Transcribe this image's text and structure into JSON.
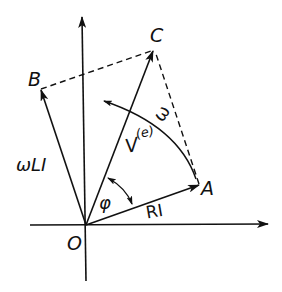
{
  "diagram": {
    "colors": {
      "ink": "#111111",
      "background": "#ffffff"
    },
    "points": {
      "O": {
        "label": "O",
        "x": 86,
        "y": 225
      },
      "A": {
        "label": "A",
        "x": 199,
        "y": 185
      },
      "B": {
        "label": "B",
        "x": 41,
        "y": 89
      },
      "C": {
        "label": "C",
        "x": 154,
        "y": 50
      }
    },
    "vectors": [
      {
        "id": "RI",
        "from": "O",
        "to": "A",
        "label": "RI",
        "style": "solid"
      },
      {
        "id": "omegaLI",
        "from": "O",
        "to": "B",
        "label": "ωLI",
        "style": "solid"
      },
      {
        "id": "Ve",
        "from": "O",
        "to": "C",
        "label_main": "V",
        "label_sup": "(e)",
        "style": "solid"
      }
    ],
    "dashed_lines": [
      {
        "from": "B",
        "to": "C"
      },
      {
        "from": "A",
        "to": "C"
      }
    ],
    "axes": {
      "x_axis": {
        "from": [
          30,
          225
        ],
        "to": [
          268,
          225
        ],
        "arrow": true
      },
      "y_axis": {
        "from": [
          86,
          281
        ],
        "to": [
          82,
          17
        ],
        "arrow": true
      }
    },
    "angle": {
      "label": "φ",
      "between": [
        "RI",
        "Ve"
      ],
      "double_arrow": true
    },
    "rotation": {
      "label": "ω",
      "direction": "counterclockwise"
    },
    "labels": {
      "O": "O",
      "A": "A",
      "B": "B",
      "C": "C",
      "RI": "RI",
      "omegaLI": "ωLI",
      "V_main": "V",
      "V_sup": "(e)",
      "phi": "φ",
      "omega": "ω"
    }
  }
}
